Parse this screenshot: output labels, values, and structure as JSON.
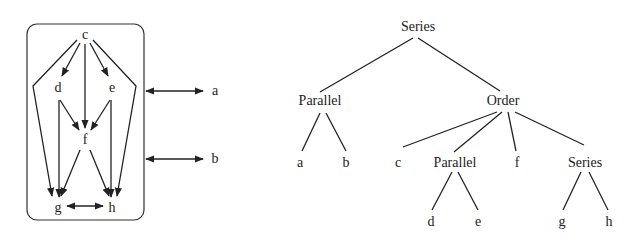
{
  "colors": {
    "ink": "#222222",
    "background": "#ffffff"
  },
  "graph": {
    "nodes": [
      {
        "id": "c",
        "label": "c",
        "x": 85,
        "y": 35
      },
      {
        "id": "d",
        "label": "d",
        "x": 58,
        "y": 88
      },
      {
        "id": "e",
        "label": "e",
        "x": 112,
        "y": 88
      },
      {
        "id": "f",
        "label": "f",
        "x": 85,
        "y": 140
      },
      {
        "id": "g",
        "label": "g",
        "x": 58,
        "y": 208
      },
      {
        "id": "h",
        "label": "h",
        "x": 112,
        "y": 208
      }
    ],
    "external_nodes": [
      {
        "id": "a",
        "label": "a",
        "x": 215,
        "y": 91
      },
      {
        "id": "b",
        "label": "b",
        "x": 215,
        "y": 159
      }
    ],
    "edges": [
      {
        "from": "c",
        "to": "d"
      },
      {
        "from": "c",
        "to": "e"
      },
      {
        "from": "c",
        "to": "f"
      },
      {
        "from": "c",
        "to": "g",
        "via": "left-bend"
      },
      {
        "from": "c",
        "to": "h",
        "via": "right-bend"
      },
      {
        "from": "d",
        "to": "f"
      },
      {
        "from": "e",
        "to": "f"
      },
      {
        "from": "d",
        "to": "g"
      },
      {
        "from": "e",
        "to": "h"
      },
      {
        "from": "f",
        "to": "g"
      },
      {
        "from": "f",
        "to": "h"
      },
      {
        "from": "g",
        "to": "h",
        "bidirectional": true
      },
      {
        "from": "box",
        "to": "a",
        "bidirectional": true
      },
      {
        "from": "box",
        "to": "b",
        "bidirectional": true
      }
    ]
  },
  "tree": {
    "root": {
      "label": "Series",
      "x": 347,
      "y": 27
    },
    "level1": [
      {
        "label": "Parallel",
        "x": 320,
        "y": 101
      },
      {
        "label": "Order",
        "x": 503,
        "y": 101
      }
    ],
    "level2": [
      {
        "label": "a",
        "x": 300,
        "y": 163,
        "parent": "Parallel"
      },
      {
        "label": "b",
        "x": 346,
        "y": 163,
        "parent": "Parallel"
      },
      {
        "label": "c",
        "x": 397,
        "y": 163,
        "parent": "Order"
      },
      {
        "label": "Parallel",
        "x": 438,
        "y": 163,
        "parent": "Order"
      },
      {
        "label": "f",
        "x": 517,
        "y": 163,
        "parent": "Order"
      },
      {
        "label": "Series",
        "x": 585,
        "y": 163,
        "parent": "Order"
      }
    ],
    "level3": [
      {
        "label": "d",
        "x": 431,
        "y": 222,
        "parent": "Parallel"
      },
      {
        "label": "e",
        "x": 478,
        "y": 222,
        "parent": "Parallel"
      },
      {
        "label": "g",
        "x": 562,
        "y": 222,
        "parent": "Series"
      },
      {
        "label": "h",
        "x": 609,
        "y": 222,
        "parent": "Series"
      }
    ]
  }
}
